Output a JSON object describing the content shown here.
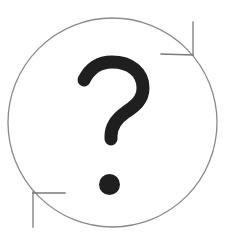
{
  "image": {
    "description": "Question mark inside a circle with two refresh-style arrow corners",
    "icon": "question-refresh-icon",
    "colors": {
      "background": "#ffffff",
      "circle_stroke": "#8a8a8a",
      "arrow_stroke": "#7a7a7a",
      "question_mark": "#1f1f1f"
    },
    "label": "?"
  }
}
